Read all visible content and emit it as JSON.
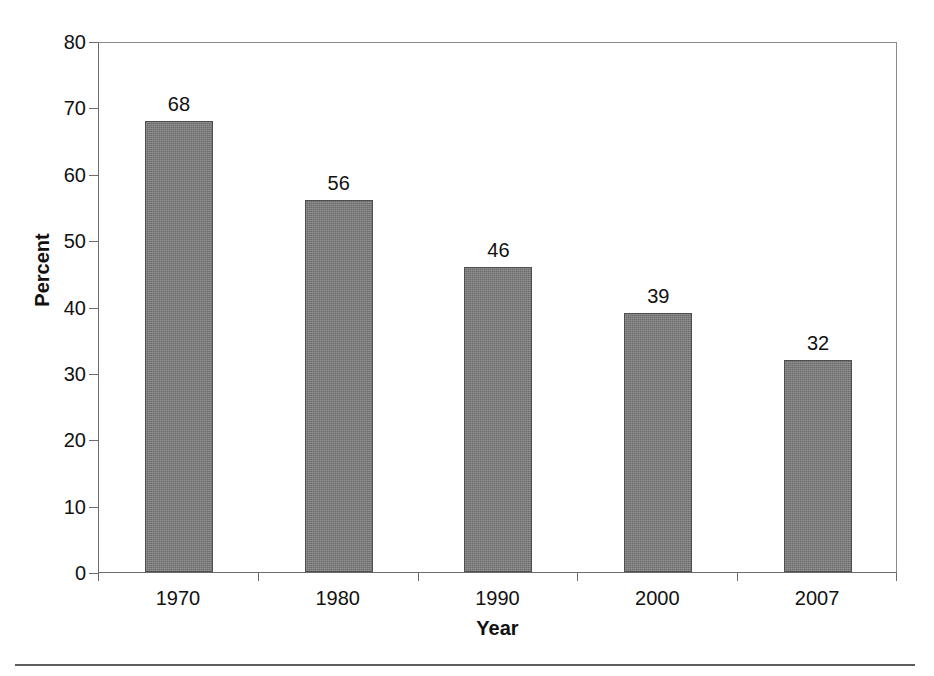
{
  "chart_data": {
    "type": "bar",
    "title": "",
    "subtitle": "",
    "xlabel": "Year",
    "ylabel": "Percent",
    "categories": [
      "1970",
      "1980",
      "1990",
      "2000",
      "2007"
    ],
    "values": [
      68,
      56,
      46,
      39,
      32
    ],
    "data_labels": [
      "68",
      "56",
      "46",
      "39",
      "32"
    ],
    "ylim": [
      0,
      80
    ],
    "ytick_labels": [
      "80",
      "70",
      "60",
      "50",
      "40",
      "30",
      "20",
      "10",
      "0"
    ],
    "ytick_values": [
      80,
      70,
      60,
      50,
      40,
      30,
      20,
      10,
      0
    ],
    "grid": false,
    "legend": null,
    "legend_position": "none",
    "series": [
      {
        "name": "Percent",
        "values": [
          68,
          56,
          46,
          39,
          32
        ],
        "color": "#7d7d7d"
      }
    ],
    "annotations": []
  },
  "style": {
    "bar_fill": "#7d7d7d",
    "bar_outline": "#4f4f4f",
    "axis_color": "#6b6b6b",
    "text_color": "#111111",
    "background": "#ffffff",
    "rule_color": "#5d5d5d"
  }
}
